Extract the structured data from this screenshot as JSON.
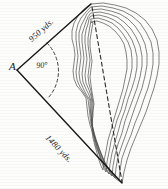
{
  "figure": {
    "background_color": "#fdfdfc",
    "ink_color": "#1a1a1a",
    "contour_color": "#555555"
  },
  "labels": {
    "vertex_a": "A",
    "angle": "90°",
    "side_upper": "950 yds.",
    "side_lower": "1480 yds."
  },
  "geometry": {
    "vertex_a_point": [
      17,
      70
    ],
    "top_point": [
      91,
      4
    ],
    "bottom_point": [
      122,
      183
    ],
    "angle_degrees": 90,
    "side_upper_length_yds": 950,
    "side_lower_length_yds": 1480,
    "angle_arc_style": "dashed",
    "baseline_style": "dashed"
  },
  "contours": {
    "count": 7,
    "description": "nested irregular closed contour lines forming an elongated island"
  }
}
